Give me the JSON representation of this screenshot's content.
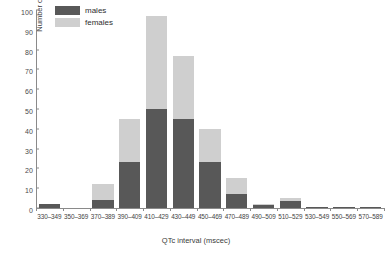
{
  "chart_data": {
    "type": "bar",
    "subtype": "stacked-histogram",
    "title": "",
    "xlabel": "QTc interval (mscec)",
    "ylabel": "Number of patients",
    "ylim": [
      0,
      100
    ],
    "yticks": [
      0,
      10,
      20,
      30,
      40,
      50,
      60,
      70,
      80,
      90,
      100
    ],
    "grid": false,
    "legend_position": "top-left",
    "categories": [
      "330-349",
      "350-369",
      "370-389",
      "390-409",
      "410-429",
      "430-449",
      "450-469",
      "470-489",
      "490-509",
      "510-529",
      "530-549",
      "550-569",
      "570-589"
    ],
    "series": [
      {
        "name": "males",
        "color": "#585858",
        "values": [
          2,
          0,
          4,
          23,
          50,
          45,
          23,
          7,
          1.5,
          3.5,
          0.4,
          0.4,
          0.4
        ]
      },
      {
        "name": "females",
        "color": "#cfcfcf",
        "values": [
          0,
          0,
          8,
          22,
          47,
          32,
          17,
          8,
          0.5,
          1.5,
          0,
          0,
          0
        ]
      }
    ],
    "totals": [
      2,
      0,
      12,
      45,
      97,
      77,
      40,
      15,
      2,
      5,
      0.4,
      0.4,
      0.4
    ]
  },
  "legend": {
    "items": [
      {
        "label": "males",
        "color": "#585858"
      },
      {
        "label": "females",
        "color": "#cfcfcf"
      }
    ]
  }
}
